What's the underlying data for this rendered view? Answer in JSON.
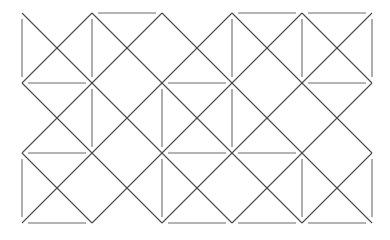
{
  "figure": {
    "width": 390,
    "height": 240,
    "background_color": "#ffffff"
  },
  "chart_data": {
    "type": "diagram",
    "title": "",
    "subtitle": "",
    "xlabel": "",
    "ylabel": "",
    "grid": false,
    "legend": null,
    "geometry": {
      "origin_x": 22,
      "origin_y": 13,
      "pitch_x": 70,
      "pitch_y": 70,
      "columns": 6,
      "rows": 4,
      "node_count": 24,
      "extent_x": [
        22,
        372
      ],
      "extent_y": [
        13,
        223
      ]
    },
    "style": {
      "stroke_color": "#4a4a4a",
      "stroke_width": 1.1,
      "diagonal_stroke_color": "#4a4a4a",
      "dash_stroke_color": "#6a6a6a",
      "dash_inset": 6,
      "line_cap": "butt"
    },
    "x": [
      22,
      92,
      162,
      232,
      302,
      372
    ],
    "y": [
      13,
      83,
      153,
      223
    ],
    "diagonals_down": [
      {
        "x1": 22,
        "y1": 13,
        "x2": 232,
        "y2": 223
      },
      {
        "x1": 92,
        "y1": 13,
        "x2": 302,
        "y2": 223
      },
      {
        "x1": 162,
        "y1": 13,
        "x2": 372,
        "y2": 223
      },
      {
        "x1": 232,
        "y1": 13,
        "x2": 372,
        "y2": 153
      },
      {
        "x1": 302,
        "y1": 13,
        "x2": 372,
        "y2": 83
      },
      {
        "x1": 22,
        "y1": 83,
        "x2": 162,
        "y2": 223
      },
      {
        "x1": 22,
        "y1": 153,
        "x2": 92,
        "y2": 223
      }
    ],
    "diagonals_up": [
      {
        "x1": 22,
        "y1": 223,
        "x2": 232,
        "y2": 13
      },
      {
        "x1": 92,
        "y1": 223,
        "x2": 302,
        "y2": 13
      },
      {
        "x1": 162,
        "y1": 223,
        "x2": 372,
        "y2": 13
      },
      {
        "x1": 232,
        "y1": 223,
        "x2": 372,
        "y2": 83
      },
      {
        "x1": 302,
        "y1": 223,
        "x2": 372,
        "y2": 153
      },
      {
        "x1": 22,
        "y1": 153,
        "x2": 162,
        "y2": 13
      },
      {
        "x1": 22,
        "y1": 83,
        "x2": 92,
        "y2": 13
      }
    ],
    "horizontal_dashes": [
      {
        "row": 0,
        "col": 1,
        "x1": 92,
        "x2": 162,
        "y": 13
      },
      {
        "row": 0,
        "col": 3,
        "x1": 232,
        "x2": 302,
        "y": 13
      },
      {
        "row": 0,
        "col": 4,
        "x1": 302,
        "x2": 372,
        "y": 13
      },
      {
        "row": 1,
        "col": 0,
        "x1": 22,
        "x2": 92,
        "y": 83
      },
      {
        "row": 1,
        "col": 2,
        "x1": 162,
        "x2": 232,
        "y": 83
      },
      {
        "row": 1,
        "col": 4,
        "x1": 302,
        "x2": 372,
        "y": 83
      },
      {
        "row": 2,
        "col": 0,
        "x1": 22,
        "x2": 92,
        "y": 153
      },
      {
        "row": 2,
        "col": 2,
        "x1": 162,
        "x2": 232,
        "y": 153
      },
      {
        "row": 2,
        "col": 3,
        "x1": 232,
        "x2": 302,
        "y": 153
      },
      {
        "row": 3,
        "col": 0,
        "x1": 22,
        "x2": 92,
        "y": 223
      },
      {
        "row": 3,
        "col": 2,
        "x1": 162,
        "x2": 232,
        "y": 223
      },
      {
        "row": 3,
        "col": 3,
        "x1": 232,
        "x2": 302,
        "y": 223
      },
      {
        "row": 3,
        "col": 4,
        "x1": 302,
        "x2": 372,
        "y": 223
      }
    ],
    "vertical_dashes": [
      {
        "col": 0,
        "row": 0,
        "y1": 13,
        "y2": 83,
        "x": 22
      },
      {
        "col": 0,
        "row": 2,
        "y1": 153,
        "y2": 223,
        "x": 22
      },
      {
        "col": 1,
        "row": 0,
        "y1": 13,
        "y2": 83,
        "x": 92
      },
      {
        "col": 1,
        "row": 1,
        "y1": 83,
        "y2": 153,
        "x": 92
      },
      {
        "col": 2,
        "row": 1,
        "y1": 83,
        "y2": 153,
        "x": 162
      },
      {
        "col": 2,
        "row": 2,
        "y1": 153,
        "y2": 223,
        "x": 162
      },
      {
        "col": 3,
        "row": 0,
        "y1": 13,
        "y2": 83,
        "x": 232
      },
      {
        "col": 3,
        "row": 1,
        "y1": 83,
        "y2": 153,
        "x": 232
      },
      {
        "col": 4,
        "row": 0,
        "y1": 13,
        "y2": 83,
        "x": 302
      },
      {
        "col": 4,
        "row": 2,
        "y1": 153,
        "y2": 223,
        "x": 302
      },
      {
        "col": 5,
        "row": 0,
        "y1": 13,
        "y2": 83,
        "x": 372
      },
      {
        "col": 5,
        "row": 2,
        "y1": 153,
        "y2": 223,
        "x": 372
      }
    ]
  }
}
